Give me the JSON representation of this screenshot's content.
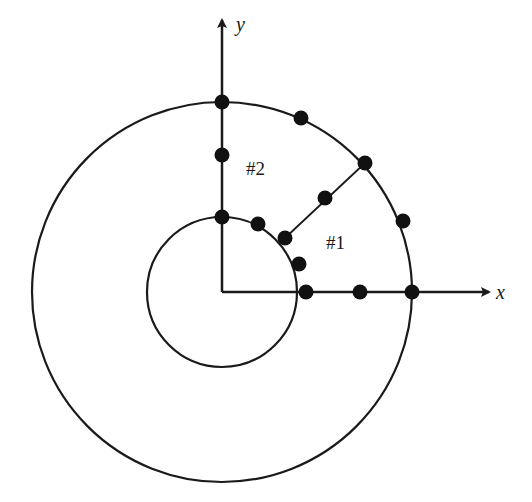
{
  "diagram": {
    "type": "polar-mesh-diagram",
    "colors": {
      "stroke": "#1a1a1a",
      "node": "#111111",
      "background": "#ffffff"
    },
    "origin": {
      "x": 222,
      "y": 292
    },
    "axes": {
      "x": {
        "label": "x",
        "end": {
          "x": 489,
          "y": 292
        },
        "label_pos": {
          "x": 496,
          "y": 299
        }
      },
      "y": {
        "label": "y",
        "end": {
          "x": 222,
          "y": 20
        },
        "label_pos": {
          "x": 236,
          "y": 31
        }
      }
    },
    "circles": [
      {
        "name": "inner-circle",
        "r": 75
      },
      {
        "name": "outer-circle",
        "r": 190
      }
    ],
    "segments": [
      {
        "name": "diagonal-divider",
        "x1": 285,
        "y1": 238,
        "x2": 365,
        "y2": 163
      }
    ],
    "regions": [
      {
        "name": "region-1",
        "label": "#1",
        "x": 326,
        "y": 249
      },
      {
        "name": "region-2",
        "label": "#2",
        "x": 246,
        "y": 175
      }
    ],
    "nodes": [
      {
        "x": 222,
        "y": 102
      },
      {
        "x": 222,
        "y": 155
      },
      {
        "x": 222,
        "y": 217
      },
      {
        "x": 301,
        "y": 118
      },
      {
        "x": 365,
        "y": 163
      },
      {
        "x": 403,
        "y": 221
      },
      {
        "x": 412,
        "y": 292
      },
      {
        "x": 325,
        "y": 198
      },
      {
        "x": 258,
        "y": 224
      },
      {
        "x": 285,
        "y": 238
      },
      {
        "x": 299,
        "y": 264
      },
      {
        "x": 306,
        "y": 292
      },
      {
        "x": 360,
        "y": 292
      }
    ],
    "node_radius": 7.5
  }
}
